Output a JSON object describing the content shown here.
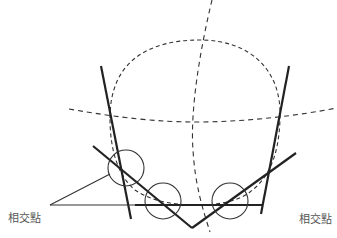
{
  "diagram": {
    "labels": {
      "left": "相交點",
      "right": "相交點"
    },
    "colors": {
      "line": "#222222",
      "dashed": "#333333",
      "thin": "#333333",
      "label": "#555555"
    },
    "elements": {
      "dashed_circle": "construction circle (dashed)",
      "dashed_vertical_axis": "curved dashed vertical axis",
      "dashed_horizontal_axis": "curved dashed horizontal axis",
      "thick_lines": [
        "left steep line",
        "right steep line",
        "left diagonal",
        "right diagonal",
        "bottom horizontal"
      ],
      "intersection_circles": 3
    }
  }
}
